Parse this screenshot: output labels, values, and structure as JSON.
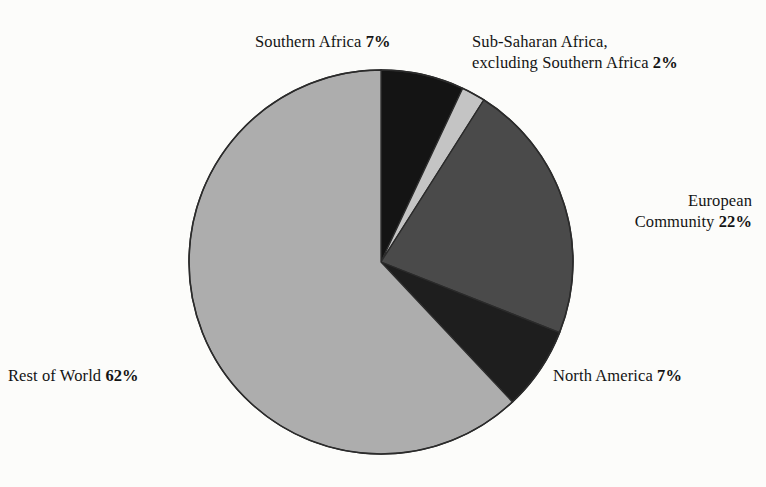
{
  "chart_data": {
    "type": "pie",
    "title": "",
    "subtitle": "",
    "xlabel": "",
    "ylabel": "",
    "legend_position": "outside-callout-labels",
    "grid": false,
    "units": "percent",
    "start_angle_deg": 0,
    "direction": "clockwise",
    "categories": [
      "Southern Africa",
      "Sub-Saharan Africa, excluding Southern Africa",
      "European Community",
      "North America",
      "Rest of World"
    ],
    "values": [
      7,
      2,
      22,
      7,
      62
    ],
    "slices": [
      {
        "name": "southern-africa",
        "label": "Southern Africa",
        "value": 7,
        "value_text": "7%",
        "color": "#141414",
        "start_deg": 0,
        "end_deg": 25.2
      },
      {
        "name": "sub-saharan-africa-excluding-southern-africa",
        "label_line1": "Sub-Saharan Africa,",
        "label_line2": "excluding Southern Africa",
        "label": "Sub-Saharan Africa, excluding Southern Africa",
        "value": 2,
        "value_text": "2%",
        "color": "#c4c4c4",
        "start_deg": 25.2,
        "end_deg": 32.4
      },
      {
        "name": "european-community",
        "label_line1": "European",
        "label_line2": "Community",
        "label": "European Community",
        "value": 22,
        "value_text": "22%",
        "color": "#4a4a4a",
        "start_deg": 32.4,
        "end_deg": 111.6
      },
      {
        "name": "north-america",
        "label": "North America",
        "value": 7,
        "value_text": "7%",
        "color": "#1e1e1e",
        "start_deg": 111.6,
        "end_deg": 136.8
      },
      {
        "name": "rest-of-world",
        "label": "Rest of World",
        "value": 62,
        "value_text": "62%",
        "color": "#adadad",
        "start_deg": 136.8,
        "end_deg": 360
      }
    ],
    "geometry": {
      "center_x": 381,
      "center_y": 262,
      "radius": 192,
      "outline_color": "#2b2b2b",
      "outline_width": 1.6
    },
    "background_color": "#fcfcfa"
  },
  "labels": {
    "southern_africa": {
      "text": "Southern Africa ",
      "pct": "7%"
    },
    "sub_saharan": {
      "line1": "Sub-Saharan Africa,",
      "line2": "excluding Southern Africa ",
      "pct": "2%"
    },
    "european_community": {
      "line1": "European",
      "line2": "Community ",
      "pct": "22%"
    },
    "north_america": {
      "text": "North America ",
      "pct": "7%"
    },
    "rest_of_world": {
      "text": "Rest of World ",
      "pct": "62%"
    }
  }
}
